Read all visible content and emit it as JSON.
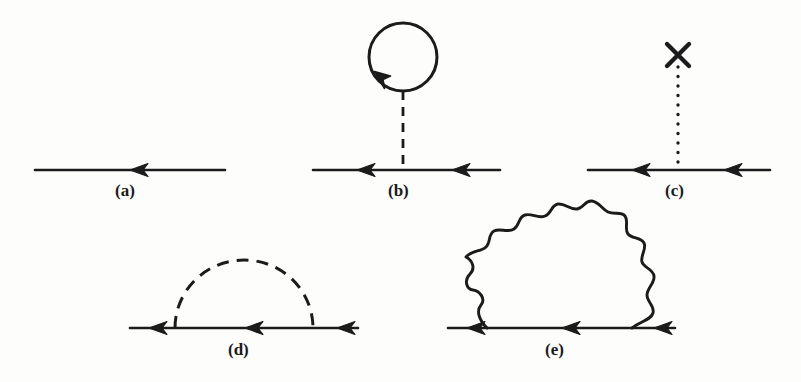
{
  "figure": {
    "kind": "feynman-diagram-panel",
    "background_color": "#fdfdfc",
    "ink_color": "#1b1b1b",
    "panel_count": 5,
    "labels": {
      "a": "(a)",
      "b": "(b)",
      "c": "(c)",
      "d": "(d)",
      "e": "(e)"
    },
    "panels": [
      {
        "id": "a",
        "label": "(a)",
        "description": "free fermion propagator",
        "label_x": 115,
        "label_y": 182,
        "fermion_line": {
          "x1": 35,
          "y1": 170,
          "x2": 225,
          "y2": 170
        },
        "arrows": [
          {
            "x": 130,
            "y": 170,
            "direction": "left"
          }
        ]
      },
      {
        "id": "b",
        "label": "(b)",
        "description": "tadpole self-energy with scalar loop",
        "label_x": 388,
        "label_y": 182,
        "fermion_line": {
          "x1": 313,
          "y1": 170,
          "x2": 500,
          "y2": 170
        },
        "arrows": [
          {
            "x": 360,
            "y": 170,
            "direction": "left"
          },
          {
            "x": 455,
            "y": 170,
            "direction": "left"
          }
        ],
        "loop": {
          "cx": 403,
          "cy": 57,
          "r": 34,
          "style": "solid",
          "arrow_angle_deg": 218
        },
        "dashed_line": {
          "x1": 403,
          "y1": 91,
          "x2": 403,
          "y2": 170,
          "style": "dashed"
        }
      },
      {
        "id": "c",
        "label": "(c)",
        "description": "counterterm / external cross insertion on dotted line",
        "label_x": 665,
        "label_y": 182,
        "fermion_line": {
          "x1": 588,
          "y1": 170,
          "x2": 770,
          "y2": 170
        },
        "arrows": [
          {
            "x": 635,
            "y": 170,
            "direction": "left"
          },
          {
            "x": 727,
            "y": 170,
            "direction": "left"
          }
        ],
        "dotted_line": {
          "x1": 678,
          "y1": 67,
          "x2": 678,
          "y2": 170,
          "style": "dotted"
        },
        "cross": {
          "cx": 678,
          "cy": 55,
          "size": 13
        }
      },
      {
        "id": "d",
        "label": "(d)",
        "description": "self-energy with dashed scalar exchange",
        "label_x": 228,
        "label_y": 341,
        "fermion_line": {
          "x1": 130,
          "y1": 328,
          "x2": 358,
          "y2": 328
        },
        "arrows": [
          {
            "x": 152,
            "y": 328,
            "direction": "left"
          },
          {
            "x": 248,
            "y": 328,
            "direction": "left"
          },
          {
            "x": 340,
            "y": 328,
            "direction": "left"
          }
        ],
        "arc": {
          "cx": 244,
          "cy": 328,
          "rx": 69,
          "ry": 68,
          "style": "dashed",
          "x_left": 175,
          "x_right": 313,
          "top_y": 260
        }
      },
      {
        "id": "e",
        "label": "(e)",
        "description": "self-energy with wavy photon exchange",
        "label_x": 545,
        "label_y": 341,
        "fermion_line": {
          "x1": 448,
          "y1": 328,
          "x2": 675,
          "y2": 328
        },
        "arrows": [
          {
            "x": 470,
            "y": 328,
            "direction": "left"
          },
          {
            "x": 565,
            "y": 328,
            "direction": "left"
          },
          {
            "x": 657,
            "y": 328,
            "direction": "left"
          }
        ],
        "arc": {
          "cx": 559,
          "cy": 328,
          "rx": 72,
          "ry": 66,
          "style": "wavy",
          "x_left": 487,
          "x_right": 632,
          "top_y": 262,
          "wiggles": 11
        }
      }
    ]
  }
}
